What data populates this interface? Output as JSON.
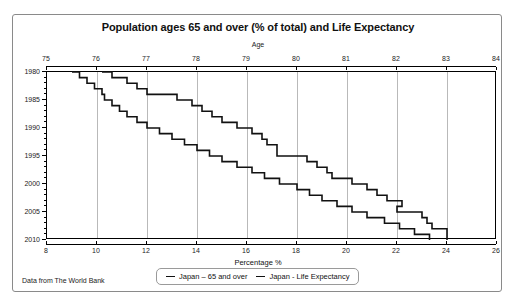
{
  "card": {
    "title": "Population ages 65 and over (% of total) and Life Expectancy",
    "source_note": "Data from The World Bank"
  },
  "legend": {
    "items": [
      {
        "label": "Japan – 65 and over",
        "color": "#111111"
      },
      {
        "label": "Japan - Life Expectancy",
        "color": "#111111"
      }
    ]
  },
  "chart_data": {
    "type": "line",
    "title": "Population ages 65 and over (% of total) and Life Expectancy",
    "subtitle": "",
    "note": "Data from The World Bank",
    "orientation": "year-on-vertical-axis",
    "grid": true,
    "legend_position": "bottom-center",
    "axes": {
      "top": {
        "label": "Age",
        "ticks": [
          75,
          76,
          77,
          78,
          79,
          80,
          81,
          82,
          83,
          84
        ],
        "range": [
          75,
          84
        ]
      },
      "bottom": {
        "label": "Percentage %",
        "ticks": [
          8,
          10,
          12,
          14,
          16,
          18,
          20,
          22,
          24,
          26
        ],
        "range": [
          8,
          26
        ]
      },
      "left": {
        "label": "",
        "ticks": [
          1980,
          1985,
          1990,
          1995,
          2000,
          2005,
          2010
        ],
        "minor_tick_step": 1,
        "range": [
          1980,
          2010
        ],
        "direction": "descending-downward"
      }
    },
    "series": [
      {
        "name": "Japan – 65 and over",
        "x_axis": "bottom",
        "x_unit": "percent",
        "color": "#111111",
        "points": [
          {
            "year": 1980,
            "value": 9.0
          },
          {
            "year": 1981,
            "value": 9.3
          },
          {
            "year": 1982,
            "value": 9.6
          },
          {
            "year": 1983,
            "value": 9.9
          },
          {
            "year": 1984,
            "value": 10.2
          },
          {
            "year": 1985,
            "value": 10.3
          },
          {
            "year": 1986,
            "value": 10.6
          },
          {
            "year": 1987,
            "value": 10.9
          },
          {
            "year": 1988,
            "value": 11.2
          },
          {
            "year": 1989,
            "value": 11.6
          },
          {
            "year": 1990,
            "value": 12.0
          },
          {
            "year": 1991,
            "value": 12.5
          },
          {
            "year": 1992,
            "value": 13.0
          },
          {
            "year": 1993,
            "value": 13.5
          },
          {
            "year": 1994,
            "value": 14.0
          },
          {
            "year": 1995,
            "value": 14.5
          },
          {
            "year": 1996,
            "value": 15.0
          },
          {
            "year": 1997,
            "value": 15.6
          },
          {
            "year": 1998,
            "value": 16.2
          },
          {
            "year": 1999,
            "value": 16.7
          },
          {
            "year": 2000,
            "value": 17.3
          },
          {
            "year": 2001,
            "value": 18.0
          },
          {
            "year": 2002,
            "value": 18.5
          },
          {
            "year": 2003,
            "value": 19.0
          },
          {
            "year": 2004,
            "value": 19.6
          },
          {
            "year": 2005,
            "value": 20.2
          },
          {
            "year": 2006,
            "value": 20.8
          },
          {
            "year": 2007,
            "value": 21.5
          },
          {
            "year": 2008,
            "value": 22.1
          },
          {
            "year": 2009,
            "value": 22.7
          },
          {
            "year": 2010,
            "value": 23.3
          }
        ]
      },
      {
        "name": "Japan - Life Expectancy",
        "x_axis": "top",
        "x_unit": "years",
        "color": "#111111",
        "points": [
          {
            "year": 1980,
            "value": 76.1
          },
          {
            "year": 1981,
            "value": 76.3
          },
          {
            "year": 1982,
            "value": 76.6
          },
          {
            "year": 1983,
            "value": 76.8
          },
          {
            "year": 1984,
            "value": 77.0
          },
          {
            "year": 1985,
            "value": 77.6
          },
          {
            "year": 1986,
            "value": 77.9
          },
          {
            "year": 1987,
            "value": 78.1
          },
          {
            "year": 1988,
            "value": 78.3
          },
          {
            "year": 1989,
            "value": 78.5
          },
          {
            "year": 1990,
            "value": 78.8
          },
          {
            "year": 1991,
            "value": 79.1
          },
          {
            "year": 1992,
            "value": 79.3
          },
          {
            "year": 1993,
            "value": 79.4
          },
          {
            "year": 1994,
            "value": 79.6
          },
          {
            "year": 1995,
            "value": 79.6
          },
          {
            "year": 1996,
            "value": 80.2
          },
          {
            "year": 1997,
            "value": 80.4
          },
          {
            "year": 1998,
            "value": 80.6
          },
          {
            "year": 1999,
            "value": 80.7
          },
          {
            "year": 2000,
            "value": 81.1
          },
          {
            "year": 2001,
            "value": 81.4
          },
          {
            "year": 2002,
            "value": 81.6
          },
          {
            "year": 2003,
            "value": 81.8
          },
          {
            "year": 2004,
            "value": 82.1
          },
          {
            "year": 2005,
            "value": 82.0
          },
          {
            "year": 2006,
            "value": 82.5
          },
          {
            "year": 2007,
            "value": 82.6
          },
          {
            "year": 2008,
            "value": 82.7
          },
          {
            "year": 2009,
            "value": 83.0
          },
          {
            "year": 2010,
            "value": 83.0
          }
        ]
      }
    ]
  }
}
